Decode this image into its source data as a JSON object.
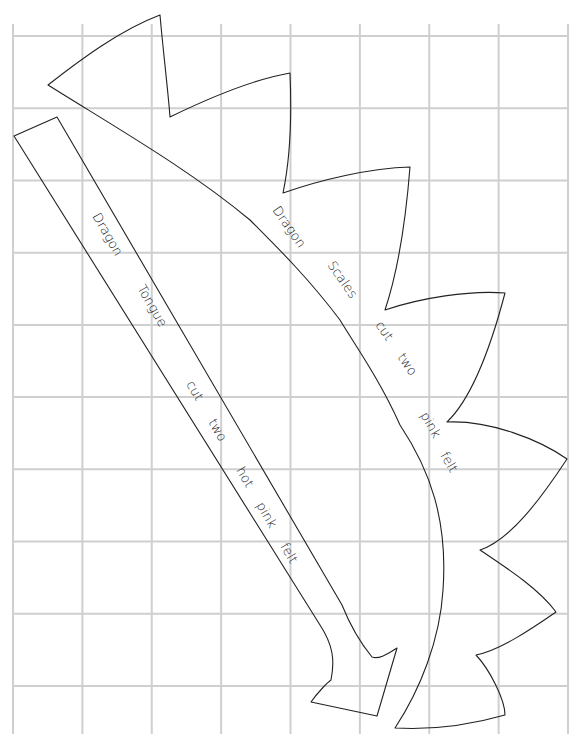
{
  "document": {
    "type": "sewing pattern on grid paper",
    "grid": {
      "columns": 8,
      "rows": 9,
      "line_color": "#cfcfcf"
    },
    "pieces": [
      {
        "id": "dragon-scales",
        "labels": [
          "Dragon",
          "Scales",
          "cut",
          "two",
          "pink",
          "felt"
        ],
        "outline_color": "#222222"
      },
      {
        "id": "dragon-tongue",
        "labels": [
          "Dragon",
          "Tongue",
          "cut",
          "two",
          "hot",
          "pink",
          "felt"
        ],
        "outline_color": "#222222"
      }
    ]
  }
}
